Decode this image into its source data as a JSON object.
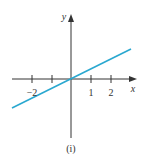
{
  "chart_data": {
    "type": "line",
    "title": "",
    "caption": "(i)",
    "xlabel": "x",
    "ylabel": "y",
    "xlim": [
      -2.95,
      3.3
    ],
    "ylim": [
      -2.95,
      3.25
    ],
    "x_ticks": [
      -2,
      -1,
      1,
      2
    ],
    "x_tick_labels": [
      "−2",
      "",
      "1",
      "2"
    ],
    "grid": false,
    "series": [
      {
        "name": "y = x/2",
        "color": "#2aa8d0",
        "x": [
          -2.95,
          3.0
        ],
        "y": [
          -1.45,
          1.5
        ]
      }
    ]
  }
}
